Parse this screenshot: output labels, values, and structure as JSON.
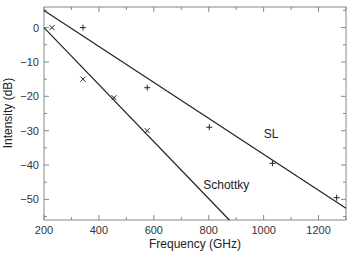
{
  "chart_data": {
    "type": "scatter",
    "title": "",
    "xlabel": "Frequency (GHz)",
    "ylabel": "Intensity (dB)",
    "xlim": [
      200,
      1300
    ],
    "ylim": [
      -56,
      6
    ],
    "grid": false,
    "legend": null,
    "xticks": [
      200,
      400,
      600,
      800,
      1000,
      1200
    ],
    "xticks_minor": [
      300,
      500,
      700,
      900,
      1100,
      1300
    ],
    "yticks": [
      0,
      -10,
      -20,
      -30,
      -40,
      -50
    ],
    "yticks_minor": [
      5,
      -5,
      -15,
      -25,
      -35,
      -45,
      -55
    ],
    "series": [
      {
        "name": "SL",
        "marker": "+",
        "points": [
          [
            342,
            0
          ],
          [
            576,
            -17.5
          ],
          [
            802,
            -29
          ],
          [
            1032,
            -39.5
          ],
          [
            1266,
            -49.5
          ]
        ],
        "fit_line": [
          [
            200,
            5
          ],
          [
            1300,
            -52.6
          ]
        ]
      },
      {
        "name": "Schottky",
        "marker": "x",
        "points": [
          [
            229,
            0
          ],
          [
            342,
            -15
          ],
          [
            455,
            -20.4
          ],
          [
            576,
            -30
          ]
        ],
        "fit_line": [
          [
            200,
            0
          ],
          [
            875,
            -56
          ]
        ]
      }
    ],
    "annotations": [
      {
        "text": "SL",
        "x": 1000,
        "y": -32
      },
      {
        "text": "Schottky",
        "x": 780,
        "y": -47
      }
    ]
  }
}
